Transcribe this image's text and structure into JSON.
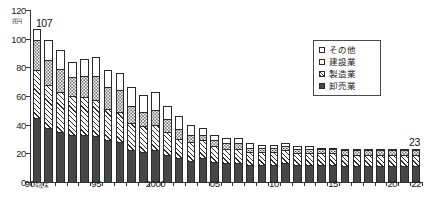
{
  "chart_data": {
    "type": "bar",
    "stacked": true,
    "title": "",
    "subtitle": "",
    "unit_label": "兆円",
    "xlabel": "年度末",
    "ylabel": "",
    "ylim": [
      0,
      120
    ],
    "ytick_values": [
      0,
      20,
      40,
      60,
      80,
      100,
      120
    ],
    "ytick_labels": [
      "0",
      "20",
      "40",
      "60",
      "80",
      "100",
      "120"
    ],
    "grid": false,
    "legend_position": "top-right",
    "categories": [
      "90",
      "91",
      "92",
      "93",
      "94",
      "95",
      "96",
      "97",
      "98",
      "99",
      "2000",
      "01",
      "02",
      "03",
      "04",
      "05",
      "06",
      "07",
      "08",
      "09",
      "10",
      "11",
      "12",
      "13",
      "14",
      "15",
      "16",
      "17",
      "18",
      "19",
      "20",
      "21",
      "22"
    ],
    "xtick_labeled": [
      "90",
      "95",
      "2000",
      "05",
      "10",
      "15",
      "20",
      "22"
    ],
    "xtick_label_display": [
      "90年度末",
      "95",
      "2000",
      "05",
      "10",
      "15",
      "20",
      "22"
    ],
    "series": [
      {
        "name": "卸売業",
        "pattern": "solid-dark",
        "values": [
          45,
          38,
          35,
          33,
          33,
          32,
          29,
          28,
          22,
          21,
          22,
          19,
          17,
          15,
          17,
          14,
          13,
          13,
          12,
          12,
          12,
          13,
          12,
          12,
          12,
          12,
          11,
          11,
          11,
          11,
          11,
          11,
          11
        ]
      },
      {
        "name": "製造業",
        "pattern": "diagonal-hatch",
        "values": [
          33,
          30,
          28,
          27,
          26,
          25,
          22,
          21,
          19,
          18,
          18,
          16,
          13,
          13,
          12,
          11,
          10,
          10,
          9,
          9,
          9,
          9,
          8,
          8,
          8,
          8,
          8,
          8,
          8,
          8,
          8,
          8,
          8
        ]
      },
      {
        "name": "建設業",
        "pattern": "dotted",
        "values": [
          21,
          17,
          16,
          13,
          15,
          17,
          15,
          15,
          12,
          10,
          10,
          9,
          7,
          5,
          4,
          4,
          4,
          4,
          3,
          3,
          3,
          3,
          3,
          3,
          3,
          3,
          3,
          3,
          3,
          3,
          3,
          3,
          3
        ]
      },
      {
        "name": "その他",
        "pattern": "white",
        "values": [
          8,
          14,
          13,
          11,
          12,
          13,
          12,
          12,
          13,
          12,
          13,
          9,
          9,
          7,
          5,
          4,
          4,
          4,
          3,
          2,
          2,
          2,
          2,
          2,
          1,
          1,
          1,
          1,
          1,
          1,
          1,
          1,
          1
        ]
      }
    ],
    "totals": [
      107,
      99,
      92,
      84,
      86,
      87,
      78,
      76,
      66,
      61,
      63,
      53,
      46,
      40,
      38,
      33,
      31,
      31,
      27,
      26,
      26,
      27,
      25,
      25,
      24,
      24,
      23,
      23,
      23,
      23,
      23,
      23,
      23
    ],
    "annotations": [
      {
        "id": "first",
        "label": "107",
        "category": "90"
      },
      {
        "id": "last",
        "label": "23",
        "category": "22"
      }
    ]
  },
  "legend": {
    "items": [
      {
        "label": "その他",
        "swatch": "white-square-icon"
      },
      {
        "label": "建設業",
        "swatch": "dotted-square-icon"
      },
      {
        "label": "製造業",
        "swatch": "hatched-square-icon"
      },
      {
        "label": "卸売業",
        "swatch": "filled-square-icon"
      }
    ]
  }
}
